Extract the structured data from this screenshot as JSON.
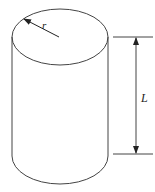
{
  "diagram": {
    "title": "",
    "shape": "cylinder",
    "labels": {
      "radius": "r",
      "length": "L"
    },
    "colors": {
      "stroke": "#333333",
      "background": "#ffffff"
    }
  }
}
